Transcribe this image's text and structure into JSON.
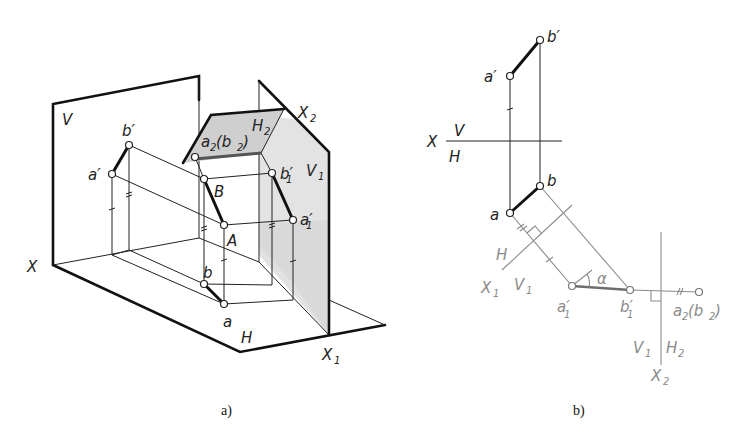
{
  "figure": {
    "colors": {
      "line": "#222222",
      "auxiliary": "#8a8a8a",
      "plane_fill": "#d8d8d8",
      "background": "#ffffff"
    }
  },
  "panel_a": {
    "caption": "a)",
    "planes": {
      "V": "V",
      "H": "H",
      "V1": "V",
      "V1_sub": "1",
      "H2": "H",
      "H2_sub": "2"
    },
    "axes": {
      "X": "X",
      "X1": "X",
      "X1_sub": "1",
      "X2": "X",
      "X2_sub": "2"
    },
    "points": {
      "a_prime": "a′",
      "b_prime": "b′",
      "A": "A",
      "B": "B",
      "a": "a",
      "b": "b",
      "a1_prime": "a′",
      "a1_sub": "1",
      "b1_prime": "b′",
      "b1_sub": "1",
      "a2b2_a": "a",
      "a2b2_sub": "2",
      "a2b2_b": "(b",
      "a2b2_close": ")"
    }
  },
  "panel_b": {
    "caption": "b)",
    "axis_labels": {
      "X": "X",
      "V": "V",
      "H": "H",
      "H_left": "H",
      "X1": "X",
      "X1_sub": "1",
      "V1": "V",
      "V1_sub": "1",
      "V1b": "V",
      "V1b_sub": "1",
      "H2": "H",
      "H2_sub": "2",
      "X2": "X",
      "X2_sub": "2"
    },
    "points": {
      "a_prime": "a′",
      "b_prime": "b′",
      "a": "a",
      "b": "b",
      "a1_prime": "a′",
      "a1_sub": "1",
      "b1_prime": "b′",
      "b1_sub": "1",
      "a2b2_a": "a",
      "a2b2_sub": "2",
      "a2b2_b": "(b",
      "a2b2_close": ")"
    },
    "angle_label": "α"
  }
}
